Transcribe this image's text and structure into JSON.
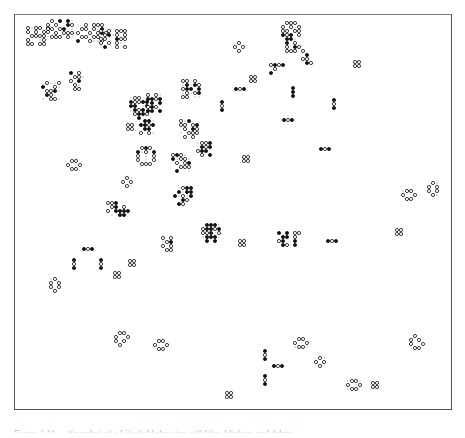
{
  "figure": {
    "caption": "Figure 1.11 — Snapshot of a Life field showing still lifes, blinkers and debris",
    "legend": {
      "live_cell": "filled circle (●)",
      "dead_cell_marker": "open circle (○)",
      "neighbor_dot": "small dot (·)"
    }
  },
  "colors": {
    "ink": "#111111",
    "border": "#555555",
    "background": "#ffffff"
  },
  "cell_size": 4,
  "patterns": [
    {
      "name": "cluster-top-left-a",
      "x": 25,
      "y": 25,
      "cells": "o.oo.o;o.o.oo;.oooo.;o...o.;oo.oo."
    },
    {
      "name": "cluster-top-left-b",
      "x": 45,
      "y": 18,
      "cells": ".o.*.*.;o.o..*o;oo.o*..;..o.ooo;.ooo.o."
    },
    {
      "name": "cluster-top-left-c",
      "x": 75,
      "y": 22,
      "cells": "..o.ooo.;.oo.o.*.;o..o.o*o;.oo.oo..;*..o..o."
    },
    {
      "name": "cluster-top-middle",
      "x": 98,
      "y": 28,
      "cells": "o.o.ooo;.o*.o.o;oo..*oo;o.o.o..;.*..o.o"
    },
    {
      "name": "blinker-left-a",
      "x": 68,
      "y": 70,
      "cells": "*.o.;.oo.;o.*.;.o..;.oo."
    },
    {
      "name": "cluster-left-b",
      "x": 40,
      "y": 80,
      "cells": ".o..o;*..o.;.oo*.;.*o..;..oo."
    },
    {
      "name": "cluster-ear-left",
      "x": 128,
      "y": 95,
      "cells": ".oo..;*oo**;**..*;.*o*.;.o**o;..*.."
    },
    {
      "name": "cluster-ear-right",
      "x": 145,
      "y": 92,
      "cells": "o.o.;**o*;.*.*;o*o.;**.*"
    },
    {
      "name": "block-pair-a",
      "x": 125,
      "y": 122,
      "cells": "oo;oo"
    },
    {
      "name": "cluster-c",
      "x": 138,
      "y": 118,
      "cells": ".**.;**o*;.**.;o.o."
    },
    {
      "name": "cluster-top-mid2",
      "x": 180,
      "y": 78,
      "cells": "oo.o.;.*.*o;o**.*;.o.o*;oo..."
    },
    {
      "name": "cluster-mid-a",
      "x": 178,
      "y": 118,
      "cells": "o.*..;oo.o*;.o.*o;..ooo;.o.o."
    },
    {
      "name": "cluster-mid-b",
      "x": 195,
      "y": 140,
      "cells": ".oo*;.*o*;o**.;.o.*"
    },
    {
      "name": "ring-left",
      "x": 135,
      "y": 145,
      "cells": ".o*o.;*.o.*;o...o;o...o;.ooo."
    },
    {
      "name": "cluster-mid-c",
      "x": 170,
      "y": 152,
      "cells": "o*o..;*.oo.;.o.o*;..ooo;.*..."
    },
    {
      "name": "cluster-top-right",
      "x": 280,
      "y": 20,
      "cells": ".ooo.;o.o.o;oo.oo;*o*.o;.**..;.*.o.;.o.*o;.ooo."
    },
    {
      "name": "cluster-top-right-b",
      "x": 300,
      "y": 48,
      "cells": "o..;.*.;oo.;.*o"
    },
    {
      "name": "cluster-top-right-c",
      "x": 268,
      "y": 62,
      "cells": "o*o*;.o..;*..."
    },
    {
      "name": "blinker-v-a",
      "x": 290,
      "y": 85,
      "cells": "*;*;*"
    },
    {
      "name": "blinker-v-b",
      "x": 331,
      "y": 97,
      "cells": "*;o;*"
    },
    {
      "name": "blinker-h-a",
      "x": 219,
      "y": 99,
      "cells": "*;o;*"
    },
    {
      "name": "blinker-h-b",
      "x": 233,
      "y": 86,
      "cells": "*o*"
    },
    {
      "name": "blinker-h-c",
      "x": 281,
      "y": 117,
      "cells": "*o*"
    },
    {
      "name": "blinker-h-d",
      "x": 318,
      "y": 146,
      "cells": "*o*"
    },
    {
      "name": "block-a",
      "x": 248,
      "y": 74,
      "cells": "oo;oo"
    },
    {
      "name": "block-b",
      "x": 352,
      "y": 59,
      "cells": "oo;oo"
    },
    {
      "name": "block-c",
      "x": 241,
      "y": 154,
      "cells": "oo;oo"
    },
    {
      "name": "block-d",
      "x": 233,
      "y": 14,
      "cells": ""
    },
    {
      "name": "ring-small-a",
      "x": 232,
      "y": 40,
      "cells": ".o.;o.o;.o."
    },
    {
      "name": "beehive-a",
      "x": 65,
      "y": 158,
      "cells": ".oo.;o..o;.oo."
    },
    {
      "name": "loaf-a",
      "x": 120,
      "y": 175,
      "cells": ".o.;o.o;.o."
    },
    {
      "name": "cluster-low-a",
      "x": 105,
      "y": 200,
      "cells": "oo*..;.o*.o;o.****;...**."
    },
    {
      "name": "cluster-low-b",
      "x": 172,
      "y": 185,
      "cells": "..o**;.*.**;*.o.*;..*o.;.*o.."
    },
    {
      "name": "cluster-low-c",
      "x": 200,
      "y": 222,
      "cells": ".***.;o**o*;oo*.o;.***.;.*.*."
    },
    {
      "name": "cluster-low-d",
      "x": 160,
      "y": 235,
      "cells": "o.o;.o*;o.o;.oo"
    },
    {
      "name": "block-e",
      "x": 237,
      "y": 238,
      "cells": "oo;oo"
    },
    {
      "name": "cluster-right-mid",
      "x": 276,
      "y": 230,
      "cells": "*.*.oo;.**.o.;o*..*.;.*o.*."
    },
    {
      "name": "blinker-h-e",
      "x": 325,
      "y": 238,
      "cells": "*o*"
    },
    {
      "name": "beehive-right",
      "x": 400,
      "y": 188,
      "cells": ".oo.;o..o;.oo."
    },
    {
      "name": "pond-right",
      "x": 426,
      "y": 180,
      "cells": ".o.;o.o;o.o;.o."
    },
    {
      "name": "block-f",
      "x": 394,
      "y": 227,
      "cells": "oo;oo"
    },
    {
      "name": "blinker-h-f",
      "x": 81,
      "y": 246,
      "cells": "*o*"
    },
    {
      "name": "blinker-v-c",
      "x": 71,
      "y": 257,
      "cells": "*;o;*"
    },
    {
      "name": "blinker-v-d",
      "x": 98,
      "y": 257,
      "cells": "*;o;*"
    },
    {
      "name": "block-g",
      "x": 127,
      "y": 258,
      "cells": "oo;oo"
    },
    {
      "name": "block-h",
      "x": 112,
      "y": 270,
      "cells": "oo;oo"
    },
    {
      "name": "pond-left",
      "x": 48,
      "y": 276,
      "cells": ".o.;o.o;o.o;.o."
    },
    {
      "name": "ship-left",
      "x": 113,
      "y": 330,
      "cells": ".oo.;o..o;o.o.;.o.."
    },
    {
      "name": "beehive-low",
      "x": 152,
      "y": 338,
      "cells": ".oo.;o..o;.oo."
    },
    {
      "name": "beehive-low-b",
      "x": 292,
      "y": 336,
      "cells": ".oo.;o..o;.oo."
    },
    {
      "name": "blinker-v-e",
      "x": 262,
      "y": 348,
      "cells": "*;o;*"
    },
    {
      "name": "blinker-h-g",
      "x": 271,
      "y": 363,
      "cells": "*o*"
    },
    {
      "name": "blinker-v-f",
      "x": 262,
      "y": 373,
      "cells": "*;o;*"
    },
    {
      "name": "loaf-low",
      "x": 313,
      "y": 355,
      "cells": ".o.;o.o;.o."
    },
    {
      "name": "pond-low",
      "x": 345,
      "y": 378,
      "cells": ".oo.;o..o;.oo."
    },
    {
      "name": "block-i",
      "x": 370,
      "y": 380,
      "cells": "oo;oo"
    },
    {
      "name": "block-j",
      "x": 224,
      "y": 390,
      "cells": "oo;oo"
    },
    {
      "name": "ship-right",
      "x": 408,
      "y": 333,
      "cells": ".o..;o.o.;o..o;.oo."
    }
  ]
}
